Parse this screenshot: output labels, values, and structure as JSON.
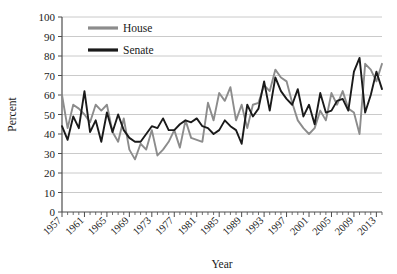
{
  "chart_data": {
    "type": "line",
    "title": "",
    "xlabel": "Year",
    "ylabel": "Percent",
    "ylim": [
      0,
      100
    ],
    "xlim": [
      1957,
      2014
    ],
    "ytick_labels": [
      "0",
      "10",
      "20",
      "30",
      "40",
      "50",
      "60",
      "70",
      "80",
      "90",
      "100"
    ],
    "ytick_values": [
      0,
      10,
      20,
      30,
      40,
      50,
      60,
      70,
      80,
      90,
      100
    ],
    "xtick_labels": [
      "1957",
      "1961",
      "1965",
      "1969",
      "1973",
      "1977",
      "1981",
      "1985",
      "1989",
      "1993",
      "1997",
      "2001",
      "2005",
      "2009",
      "2013"
    ],
    "xtick_values": [
      1957,
      1961,
      1965,
      1969,
      1973,
      1977,
      1981,
      1985,
      1989,
      1993,
      1997,
      2001,
      2005,
      2009,
      2013
    ],
    "grid": true,
    "legend_position": "top-left",
    "x": [
      1957,
      1958,
      1959,
      1960,
      1961,
      1962,
      1963,
      1964,
      1965,
      1966,
      1967,
      1968,
      1969,
      1970,
      1971,
      1972,
      1973,
      1974,
      1975,
      1976,
      1977,
      1978,
      1979,
      1980,
      1981,
      1982,
      1983,
      1984,
      1985,
      1986,
      1987,
      1988,
      1989,
      1990,
      1991,
      1992,
      1993,
      1994,
      1995,
      1996,
      1997,
      1998,
      1999,
      2000,
      2001,
      2002,
      2003,
      2004,
      2005,
      2006,
      2007,
      2008,
      2009,
      2010,
      2011,
      2012,
      2013,
      2014
    ],
    "series": [
      {
        "name": "House",
        "color": "#8c8c8c",
        "values": [
          60,
          43,
          55,
          53,
          50,
          46,
          55,
          52,
          55,
          41,
          36,
          48,
          32,
          27,
          35,
          32,
          42,
          29,
          32,
          36,
          42,
          33,
          47,
          38,
          37,
          36,
          56,
          47,
          61,
          57,
          64,
          47,
          55,
          43,
          55,
          56,
          65,
          62,
          73,
          69,
          67,
          56,
          47,
          43,
          40,
          43,
          52,
          47,
          61,
          55,
          62,
          53,
          51,
          40,
          76,
          73,
          67,
          76
        ]
      },
      {
        "name": "Senate",
        "color": "#1a1a1a",
        "values": [
          44,
          37,
          49,
          43,
          62,
          41,
          47,
          36,
          51,
          41,
          50,
          42,
          38,
          36,
          36,
          40,
          44,
          43,
          48,
          42,
          42,
          45,
          47,
          46,
          48,
          44,
          43,
          40,
          42,
          47,
          44,
          42,
          35,
          55,
          49,
          53,
          67,
          52,
          69,
          62,
          58,
          55,
          63,
          49,
          55,
          45,
          61,
          51,
          52,
          57,
          58,
          52,
          72,
          79,
          51,
          60,
          72,
          63
        ]
      }
    ]
  },
  "legend": {
    "items": [
      {
        "label": "House"
      },
      {
        "label": "Senate"
      }
    ]
  }
}
